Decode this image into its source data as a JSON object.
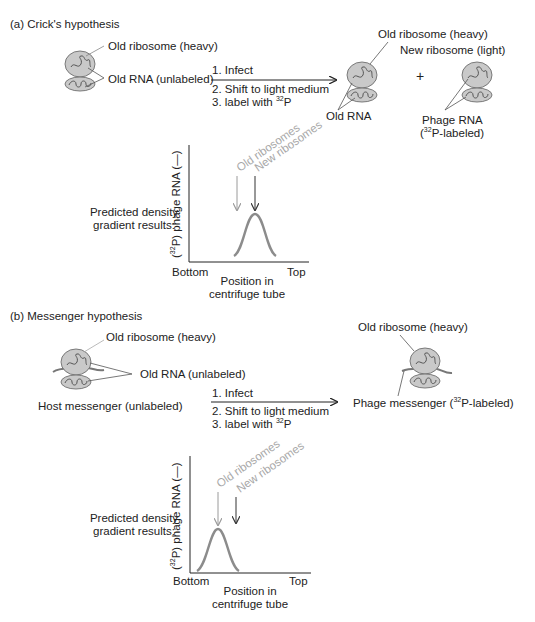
{
  "section_a": {
    "title": "(a) Crick's hypothesis",
    "left": {
      "old_ribosome": "Old ribosome (heavy)",
      "old_rna": "Old RNA (unlabeled)"
    },
    "steps": [
      "1. Infect",
      "2. Shift to light medium",
      "3. label with "
    ],
    "step3_sup": "32",
    "step3_tail": "P",
    "right": {
      "old_ribosome": "Old ribosome (heavy)",
      "new_ribosome": "New ribosome (light)",
      "old_rna": "Old RNA",
      "plus": "+",
      "phage_rna_line1": "Phage RNA",
      "phage_rna_open": "(",
      "phage_rna_sup": "32",
      "phage_rna_tail": "P-labeled)"
    },
    "predicted_line1": "Predicted density",
    "predicted_line2": "gradient results:",
    "chart": {
      "ylabel_open": "(",
      "ylabel_sup": "32",
      "ylabel_tail": "P) phage RNA (—)",
      "marker_old": "Old ribosomes",
      "marker_new": "New ribosomes",
      "x_left": "Bottom",
      "x_right": "Top",
      "xlabel_line1": "Position in",
      "xlabel_line2": "centrifuge tube"
    }
  },
  "section_b": {
    "title": "(b) Messenger hypothesis",
    "left": {
      "old_ribosome": "Old ribosome (heavy)",
      "old_rna": "Old RNA (unlabeled)",
      "host_messenger": "Host messenger (unlabeled)"
    },
    "steps": [
      "1. Infect",
      "2. Shift to light medium",
      "3. label with "
    ],
    "step3_sup": "32",
    "step3_tail": "P",
    "right": {
      "old_ribosome": "Old ribosome (heavy)",
      "phage_messenger_head": "Phage messenger (",
      "phage_messenger_sup": "32",
      "phage_messenger_tail": "P-labeled)"
    },
    "predicted_line1": "Predicted density",
    "predicted_line2": "gradient results:",
    "chart": {
      "ylabel_open": "(",
      "ylabel_sup": "32",
      "ylabel_tail": "P) phage RNA (—)",
      "marker_old": "Old ribosomes",
      "marker_new": "New ribosomes",
      "x_left": "Bottom",
      "x_right": "Top",
      "xlabel_line1": "Position in",
      "xlabel_line2": "centrifuge tube"
    }
  },
  "colors": {
    "ribosome_fill": "#c9c9c9",
    "ribosome_stroke": "#6e6e6e",
    "curve": "#8c8c8c",
    "old_marker": "#a8a8a8",
    "new_marker": "#333333",
    "text": "#222222"
  }
}
